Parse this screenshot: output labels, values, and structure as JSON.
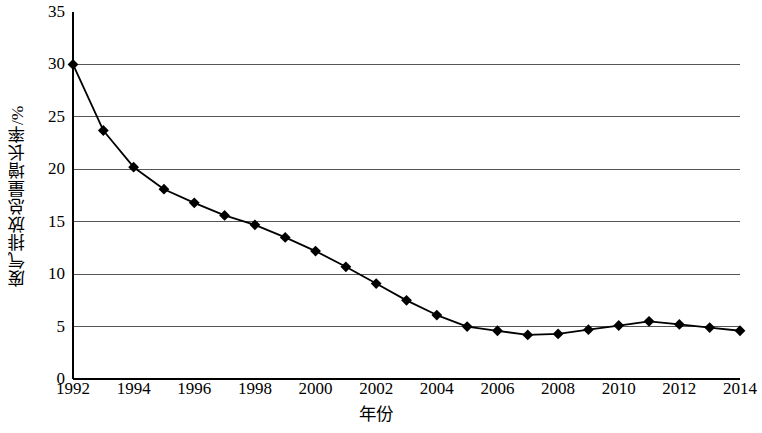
{
  "chart_data": {
    "type": "line",
    "title": "",
    "subtitle": "",
    "xlabel": "年份",
    "ylabel": "废气排放总量增长率/%",
    "xlim": [
      1992,
      2014
    ],
    "ylim": [
      0,
      35
    ],
    "grid": true,
    "legend": null,
    "marker": "diamond",
    "line_color": "#000000",
    "marker_color": "#000000",
    "grid_color": "#555555",
    "axis_color": "#000000",
    "x": [
      1992,
      1993,
      1994,
      1995,
      1996,
      1997,
      1998,
      1999,
      2000,
      2001,
      2002,
      2003,
      2004,
      2005,
      2006,
      2007,
      2008,
      2009,
      2010,
      2011,
      2012,
      2013,
      2014
    ],
    "values": [
      30.0,
      23.7,
      20.2,
      18.1,
      16.8,
      15.6,
      14.7,
      13.5,
      12.2,
      10.7,
      9.1,
      7.5,
      6.1,
      5.0,
      4.6,
      4.2,
      4.3,
      4.7,
      5.1,
      5.5,
      5.2,
      4.9,
      4.6
    ],
    "series": [
      {
        "name": "废气排放总量增长率",
        "values": [
          30.0,
          23.7,
          20.2,
          18.1,
          16.8,
          15.6,
          14.7,
          13.5,
          12.2,
          10.7,
          9.1,
          7.5,
          6.1,
          5.0,
          4.6,
          4.2,
          4.3,
          4.7,
          5.1,
          5.5,
          5.2,
          4.9,
          4.6
        ]
      }
    ],
    "y_ticks": [
      0,
      5,
      10,
      15,
      20,
      25,
      30,
      35
    ],
    "y_tick_labels": [
      "0",
      "5",
      "10",
      "15",
      "20",
      "25",
      "30",
      "35"
    ],
    "x_ticks": [
      1992,
      1994,
      1996,
      1998,
      2000,
      2002,
      2004,
      2006,
      2008,
      2010,
      2012,
      2014
    ],
    "x_tick_labels": [
      "1992",
      "1994",
      "1996",
      "1998",
      "2000",
      "2002",
      "2004",
      "2006",
      "2008",
      "2010",
      "2012",
      "2014"
    ]
  }
}
